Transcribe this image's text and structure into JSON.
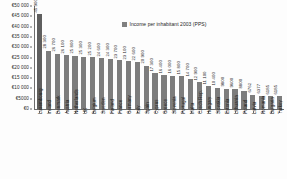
{
  "chart_data": {
    "type": "bar",
    "title": "",
    "xlabel": "",
    "ylabel": "",
    "ylim": [
      0,
      50000
    ],
    "grid": false,
    "legend_position": "top-right",
    "legend": [
      "Income per inhabitant 2003 (PPS)"
    ],
    "ytick_labels": [
      "€50 000",
      "€45 000",
      "€40 000",
      "€35 000",
      "€30 000",
      "€25 000",
      "€20 000",
      "€15 000",
      "€10 000",
      "€5000",
      "€0"
    ],
    "ytick_values": [
      50000,
      45000,
      40000,
      35000,
      30000,
      25000,
      20000,
      15000,
      10000,
      5000,
      0
    ],
    "categories": [
      "Luxembourg",
      "Ireland",
      "Denmark",
      "Austria",
      "Netherlands",
      "UK",
      "Belgium",
      "Sweden",
      "Finland",
      "France",
      "Germany",
      "Italy",
      "Spain",
      "Cyprus",
      "Greece",
      "Slovenia",
      "Portugal",
      "Malta",
      "Czech Rep.",
      "Hungary",
      "Slovakia",
      "Estonia",
      "Lithuania",
      "Poland",
      "Latvia",
      "Romania",
      "Bulgaria",
      "Turkey"
    ],
    "values": [
      45900,
      28300,
      26700,
      26100,
      25800,
      25300,
      25200,
      24600,
      24300,
      23700,
      23100,
      22600,
      20900,
      17300,
      16400,
      16000,
      15800,
      14700,
      12900,
      11100,
      10400,
      9800,
      9600,
      8800,
      6762,
      6377,
      6185,
      6185
    ],
    "data_labels": [
      "45 900",
      "28 300",
      "26 700",
      "26 100",
      "25 800",
      "25 300",
      "25 200",
      "24 600",
      "24 300",
      "23 700",
      "23 100",
      "22 600",
      "20 900",
      "17 300",
      "16 400",
      "16 000",
      "15 800",
      "14 700",
      "12 900",
      "11 100",
      "10 400",
      "9800",
      "9600",
      "8800",
      "6762",
      "6377",
      "6185",
      "6185"
    ]
  },
  "legend": {
    "series_label": "Income per inhabitant 2003 (PPS)"
  },
  "caption": {
    "text": ""
  }
}
